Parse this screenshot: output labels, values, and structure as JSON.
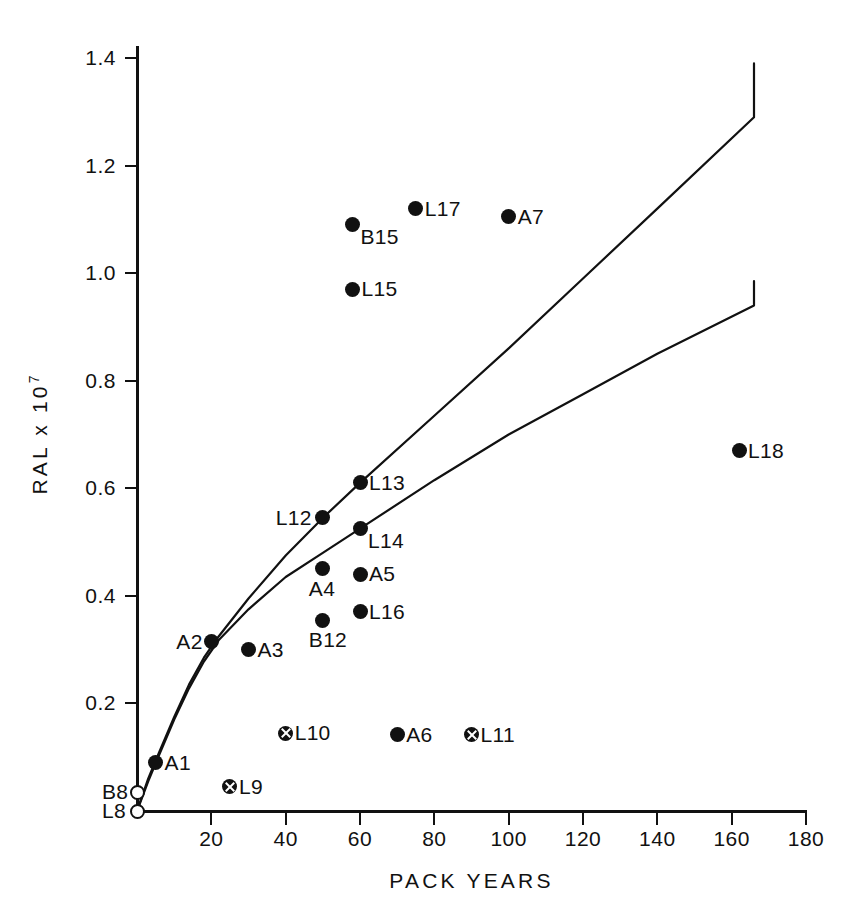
{
  "chart_data": {
    "type": "scatter",
    "title": "",
    "xlabel": "PACK YEARS",
    "ylabel": "RAL x 10",
    "ylabel_exponent": "7",
    "xlim": [
      0,
      180
    ],
    "ylim": [
      0,
      1.45
    ],
    "grid": false,
    "legend": "none",
    "xticks": [
      20,
      40,
      60,
      80,
      100,
      120,
      140,
      160,
      180
    ],
    "xtick_labels": [
      "20",
      "40",
      "60",
      "80",
      "100",
      "120",
      "140",
      "160",
      "180"
    ],
    "yticks": [
      0.2,
      0.4,
      0.6,
      0.8,
      1.0,
      1.2,
      1.4
    ],
    "ytick_labels": [
      "0.2",
      "0.4",
      "0.6",
      "0.8",
      "1.0",
      "1.2",
      "1.4"
    ],
    "points": [
      {
        "label": "L8",
        "x": 0,
        "y": 0.0,
        "marker": "open",
        "label_pos": "left"
      },
      {
        "label": "B8",
        "x": 0,
        "y": 0.035,
        "marker": "open",
        "label_pos": "left"
      },
      {
        "label": "A1",
        "x": 5,
        "y": 0.09,
        "marker": "filled",
        "label_pos": "right"
      },
      {
        "label": "L9",
        "x": 25,
        "y": 0.045,
        "marker": "crossed",
        "label_pos": "right"
      },
      {
        "label": "A2",
        "x": 20,
        "y": 0.315,
        "marker": "filled",
        "label_pos": "left"
      },
      {
        "label": "A3",
        "x": 30,
        "y": 0.3,
        "marker": "filled",
        "label_pos": "right"
      },
      {
        "label": "L10",
        "x": 40,
        "y": 0.145,
        "marker": "crossed",
        "label_pos": "right"
      },
      {
        "label": "A6",
        "x": 70,
        "y": 0.142,
        "marker": "filled",
        "label_pos": "right"
      },
      {
        "label": "L11",
        "x": 90,
        "y": 0.142,
        "marker": "crossed",
        "label_pos": "right"
      },
      {
        "label": "B12",
        "x": 50,
        "y": 0.355,
        "marker": "filled",
        "label_pos": "below"
      },
      {
        "label": "L16",
        "x": 60,
        "y": 0.37,
        "marker": "filled",
        "label_pos": "right"
      },
      {
        "label": "A4",
        "x": 50,
        "y": 0.45,
        "marker": "filled",
        "label_pos": "below"
      },
      {
        "label": "A5",
        "x": 60,
        "y": 0.44,
        "marker": "filled",
        "label_pos": "right"
      },
      {
        "label": "L12",
        "x": 50,
        "y": 0.545,
        "marker": "filled",
        "label_pos": "left"
      },
      {
        "label": "L14",
        "x": 60,
        "y": 0.525,
        "marker": "filled",
        "label_pos": "belowright"
      },
      {
        "label": "L13",
        "x": 60,
        "y": 0.61,
        "marker": "filled",
        "label_pos": "right"
      },
      {
        "label": "L18",
        "x": 162,
        "y": 0.67,
        "marker": "filled",
        "label_pos": "right"
      },
      {
        "label": "L15",
        "x": 58,
        "y": 0.97,
        "marker": "filled",
        "label_pos": "right"
      },
      {
        "label": "B15",
        "x": 58,
        "y": 1.09,
        "marker": "filled",
        "label_pos": "belowright"
      },
      {
        "label": "L17",
        "x": 75,
        "y": 1.12,
        "marker": "filled",
        "label_pos": "right"
      },
      {
        "label": "A7",
        "x": 100,
        "y": 1.105,
        "marker": "filled",
        "label_pos": "right"
      }
    ],
    "curves": [
      {
        "name": "upper-curve",
        "points": [
          [
            0,
            0.0
          ],
          [
            3,
            0.06
          ],
          [
            6,
            0.11
          ],
          [
            10,
            0.175
          ],
          [
            14,
            0.235
          ],
          [
            18,
            0.285
          ],
          [
            22,
            0.325
          ],
          [
            30,
            0.395
          ],
          [
            40,
            0.475
          ],
          [
            50,
            0.545
          ],
          [
            60,
            0.61
          ],
          [
            80,
            0.735
          ],
          [
            100,
            0.86
          ],
          [
            120,
            0.99
          ],
          [
            140,
            1.12
          ],
          [
            166,
            1.29
          ],
          [
            166,
            1.39
          ]
        ]
      },
      {
        "name": "lower-curve",
        "points": [
          [
            0,
            0.0
          ],
          [
            3,
            0.055
          ],
          [
            6,
            0.105
          ],
          [
            10,
            0.17
          ],
          [
            14,
            0.228
          ],
          [
            18,
            0.278
          ],
          [
            22,
            0.318
          ],
          [
            30,
            0.375
          ],
          [
            40,
            0.435
          ],
          [
            50,
            0.48
          ],
          [
            60,
            0.525
          ],
          [
            80,
            0.615
          ],
          [
            100,
            0.7
          ],
          [
            120,
            0.775
          ],
          [
            140,
            0.85
          ],
          [
            166,
            0.94
          ],
          [
            166,
            0.985
          ]
        ]
      }
    ],
    "colors": {
      "ink": "#111111",
      "background": "#ffffff"
    }
  }
}
